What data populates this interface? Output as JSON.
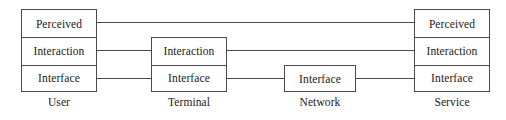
{
  "diagram": {
    "type": "layered-architecture-block-diagram",
    "background_color": "#ffffff",
    "stroke_color": "#4a4a4a",
    "text_color": "#1a1a1a",
    "layer_names": [
      "Perceived",
      "Interaction",
      "Interface"
    ],
    "nodes": [
      {
        "id": "user",
        "label": "User",
        "layers": [
          {
            "name": "Perceived"
          },
          {
            "name": "Interaction"
          },
          {
            "name": "Interface"
          }
        ]
      },
      {
        "id": "terminal",
        "label": "Terminal",
        "layers": [
          {
            "name": "Interaction"
          },
          {
            "name": "Interface"
          }
        ]
      },
      {
        "id": "network",
        "label": "Network",
        "layers": [
          {
            "name": "Interface"
          }
        ]
      },
      {
        "id": "service",
        "label": "Service",
        "layers": [
          {
            "name": "Perceived"
          },
          {
            "name": "Interaction"
          },
          {
            "name": "Interface"
          }
        ]
      }
    ],
    "connections": [
      {
        "from": "user.perceived",
        "to": "service.perceived",
        "layer": "Perceived"
      },
      {
        "from": "user.interaction",
        "to": "terminal.interaction",
        "layer": "Interaction"
      },
      {
        "from": "terminal.interaction",
        "to": "service.interaction",
        "layer": "Interaction"
      },
      {
        "from": "user.interface",
        "to": "terminal.interface",
        "layer": "Interface"
      },
      {
        "from": "terminal.interface",
        "to": "network.interface",
        "layer": "Interface"
      },
      {
        "from": "network.interface",
        "to": "service.interface",
        "layer": "Interface"
      }
    ]
  }
}
